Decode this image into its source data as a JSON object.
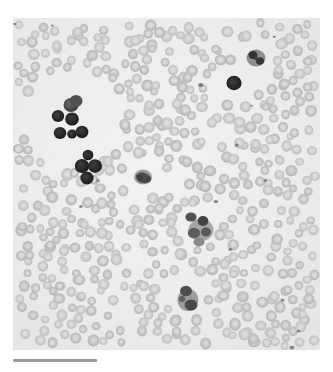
{
  "figure": {
    "kind": "light-microscopy-micrograph",
    "specimen": "peripheral blood smear",
    "staining": "romanowsky-type (wright-giemsa) rendered in grayscale",
    "background_color": "#efefed",
    "page_color": "#ffffff",
    "width_px": 333,
    "height_px": 372
  },
  "image_frame": {
    "left": 13,
    "top": 18,
    "width": 307,
    "height": 332
  },
  "scale_bar": {
    "label": "",
    "length_px": 84,
    "thickness_px": 3,
    "color": "#9a9a9a",
    "left": 13,
    "top": 359,
    "position": "bottom-left"
  },
  "palette": {
    "field_light": "#f2f2f0",
    "field_mid": "#eaeae8",
    "rbc_fill": "#c9c9c7",
    "rbc_edge": "#b4b4b2",
    "rbc_pallor": "#dedede",
    "wbc_dark": "#3a3a3a",
    "wbc_darkest": "#1f1f1f",
    "wbc_mid": "#6e6e6e",
    "wbc_cytoplasm": "#a9a9a7",
    "platelet": "#707070"
  },
  "cells": {
    "red_blood_cells": {
      "name": "red-blood-cell",
      "approx_count": 520,
      "diameter_px_range": [
        8,
        12
      ],
      "appearance": "round, pale gray, with lighter central pallor",
      "fill": "#c9c9c7",
      "pallor": "#dedede"
    },
    "white_blood_cells": [
      {
        "id": 1,
        "name": "lymphoid-cell-cluster",
        "description": "cluster of small darkly stained nucleated cells",
        "region": "upper-left",
        "count": 8,
        "cx": 72,
        "cy": 120,
        "fill": "#262626"
      },
      {
        "id": 2,
        "name": "nucleated-cell",
        "description": "darkly stained round nucleated cell",
        "region": "upper-right",
        "count": 1,
        "cx": 234,
        "cy": 83,
        "fill": "#2b2b2b"
      },
      {
        "id": 3,
        "name": "segmented-neutrophil",
        "description": "cell with lobed dark nucleus and gray cytoplasm",
        "region": "upper-right",
        "count": 1,
        "cx": 256,
        "cy": 58,
        "fill": "#3a3a3a"
      },
      {
        "id": 4,
        "name": "segmented-neutrophil",
        "description": "cell with clumped dark lobed nucleus",
        "region": "center",
        "count": 1,
        "cx": 143,
        "cy": 177,
        "fill": "#4a4a4a"
      },
      {
        "id": 5,
        "name": "segmented-neutrophil",
        "description": "large cell with multi-lobed nucleus and pale cytoplasm",
        "region": "center-right",
        "count": 1,
        "cx": 198,
        "cy": 224,
        "fill": "#565656"
      },
      {
        "id": 6,
        "name": "segmented-neutrophil",
        "description": "cell with two dark nuclear lobes",
        "region": "lower-center",
        "count": 1,
        "cx": 186,
        "cy": 294,
        "fill": "#4f4f4f"
      }
    ],
    "platelets": {
      "name": "platelet",
      "approx_count": 14,
      "diameter_px_range": [
        2,
        4
      ],
      "fill": "#707070"
    }
  }
}
